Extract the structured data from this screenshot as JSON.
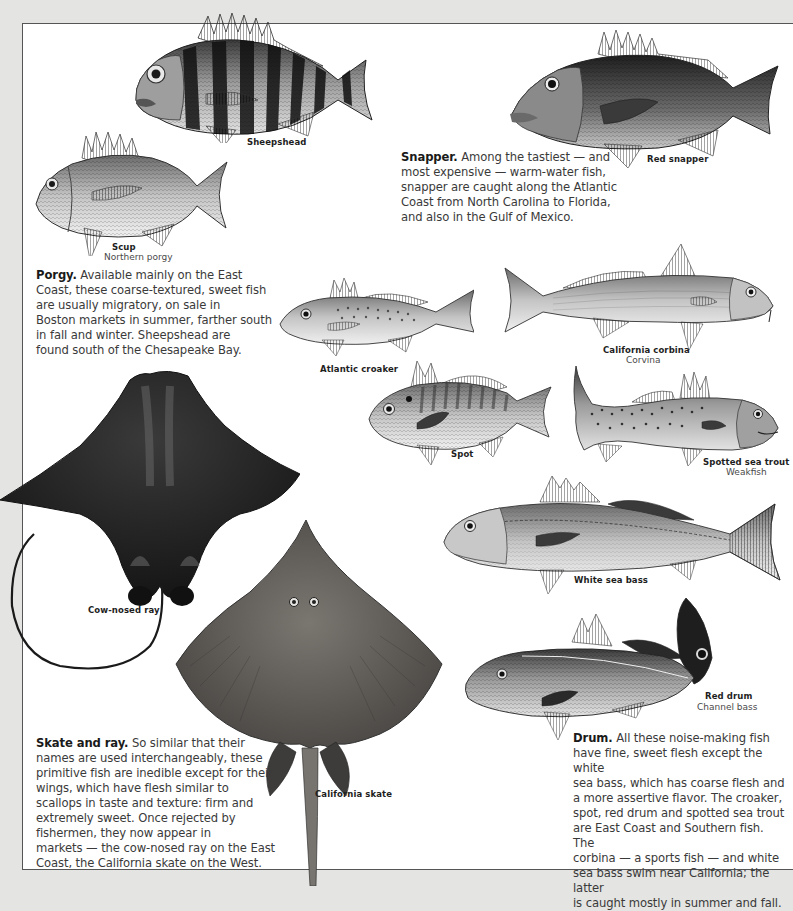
{
  "page": {
    "background_color": "#e4e4e2",
    "panel_color": "#ffffff",
    "border_color": "#555555"
  },
  "fish": {
    "sheepshead": {
      "name": "Sheepshead"
    },
    "scup": {
      "name": "Scup",
      "alt_name": "Northern porgy"
    },
    "red_snapper": {
      "name": "Red snapper"
    },
    "atlantic_croaker": {
      "name": "Atlantic croaker"
    },
    "california_corbina": {
      "name": "California corbina",
      "alt_name": "Corvina"
    },
    "spot": {
      "name": "Spot"
    },
    "spotted_sea_trout": {
      "name": "Spotted sea trout",
      "alt_name": "Weakfish"
    },
    "white_sea_bass": {
      "name": "White sea bass"
    },
    "red_drum": {
      "name": "Red drum",
      "alt_name": "Channel bass"
    },
    "cow_nosed_ray": {
      "name": "Cow-nosed ray"
    },
    "california_skate": {
      "name": "California skate"
    }
  },
  "sections": {
    "porgy": {
      "heading": "Porgy.",
      "lines": [
        " Available mainly on the East",
        "Coast, these coarse-textured, sweet fish",
        "are usually migratory, on sale in",
        "Boston markets in summer, farther south",
        "in fall and winter. Sheepshead are",
        "found south of the Chesapeake Bay."
      ]
    },
    "snapper": {
      "heading": "Snapper.",
      "lines": [
        " Among the tastiest — and",
        "most expensive — warm-water fish,",
        "snapper are caught along the Atlantic",
        "Coast from North Carolina to Florida,",
        "and also in the Gulf of Mexico."
      ]
    },
    "skate_ray": {
      "heading": "Skate and ray.",
      "lines": [
        " So similar that their",
        "names are used interchangeably, these",
        "primitive fish are inedible except for their",
        "wings, which have flesh similar to",
        "scallops in taste and texture: firm and",
        "extremely sweet. Once rejected by",
        "fishermen, they now appear in",
        "markets — the cow-nosed ray on the East",
        "Coast, the California skate on the West."
      ]
    },
    "drum": {
      "heading": "Drum.",
      "lines": [
        " All these noise-making fish",
        "have fine, sweet flesh except the white",
        "sea bass, which has coarse flesh and",
        "a more assertive flavor. The croaker,",
        "spot, red drum and spotted sea trout",
        "are East Coast and Southern fish. The",
        "corbina — a sports fish — and white",
        "sea bass swim near California; the latter",
        "is caught mostly in summer and fall."
      ]
    }
  }
}
